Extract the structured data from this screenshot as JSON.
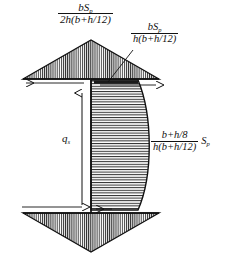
{
  "figure": {
    "background_color": "#ffffff",
    "line_color": "#111111",
    "hatch_color": "#333333"
  },
  "labels": {
    "top_left": {
      "name": "top-flange-peak-shear-formula",
      "numerator": "bS",
      "numerator_sub": "p",
      "denominator": "2h(b+h/12)",
      "denominator_sub": "",
      "tail": ""
    },
    "top_right": {
      "name": "web-junction-shear-formula",
      "numerator": "bS",
      "numerator_sub": "p",
      "denominator": "h(b+h/12)",
      "denominator_sub": "",
      "tail": ""
    },
    "right": {
      "name": "web-max-shear-formula",
      "numerator": "b+h/8",
      "numerator_sub": "",
      "denominator": "h(b+h/12)",
      "denominator_sub": "",
      "tail": "S",
      "tail_sub": "p"
    },
    "flow": {
      "name": "shear-flow-symbol",
      "symbol": "q",
      "symbol_sub": "s"
    }
  },
  "shapes": {
    "top_flange": {
      "name": "top-flange-triangle",
      "hatch": "vertical",
      "description": "Triangular shear distribution over top flange, apex up at web centerline"
    },
    "web": {
      "name": "web-parabolic-distribution",
      "hatch": "horizontal",
      "description": "Parabolic shear distribution over web, straight left edge, convex right edge"
    },
    "bottom_flange": {
      "name": "bottom-flange-triangle",
      "hatch": "vertical",
      "description": "Inverted triangular shear distribution over bottom flange, apex down at web centerline"
    }
  },
  "annotations": {
    "top_arrow": {
      "name": "top-flange-flow-arrow",
      "direction": "left"
    },
    "bottom_arrow": {
      "name": "bottom-flange-flow-arrow",
      "direction": "right"
    },
    "web_arrow": {
      "name": "web-flow-arrow",
      "direction": "up"
    },
    "leader": {
      "name": "web-junction-leader-line"
    }
  }
}
